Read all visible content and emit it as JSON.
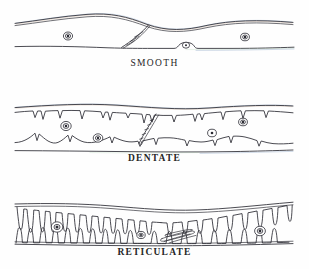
{
  "figure": {
    "background_color": "#ffffff",
    "ink_color": "#2b2b33",
    "width": 309,
    "height": 269
  },
  "panels": [
    {
      "id": "smooth",
      "label": "SMOOTH",
      "description": "Two nearly parallel wavy boundary lines enclosing a clear zone; a single oblique interdigitation near the center.",
      "nuclei_count": 3,
      "nuclei": [
        {
          "x": 68,
          "y": 36,
          "ring_r": 4.4,
          "dot_r": 1.5
        },
        {
          "x": 186,
          "y": 45,
          "ring_r": 3.4,
          "dot_r": 1.1
        },
        {
          "x": 245,
          "y": 37,
          "ring_r": 4.2,
          "dot_r": 1.4
        }
      ],
      "features": [
        "upper-undulating-margin",
        "lower-margin",
        "central-oblique-suture",
        "basal-dome"
      ]
    },
    {
      "id": "dentate",
      "label": "DENTATE",
      "description": "Boundary lines bearing short pointed tooth-like projections directed into the intervening zone.",
      "nuclei_count": 4,
      "nuclei": [
        {
          "x": 66,
          "y": 126,
          "ring_r": 5.0,
          "dot_r": 1.6
        },
        {
          "x": 98,
          "y": 138,
          "ring_r": 4.6,
          "dot_r": 1.5
        },
        {
          "x": 212,
          "y": 133,
          "ring_r": 4.3,
          "dot_r": 1.4
        },
        {
          "x": 243,
          "y": 122,
          "ring_r": 4.3,
          "dot_r": 1.4
        }
      ],
      "features": [
        "upper-outer-line",
        "upper-dentate-line",
        "lower-dentate-line",
        "lower-outer-line",
        "central-zigzag-suture"
      ]
    },
    {
      "id": "reticulate",
      "label": "RETICULATE",
      "description": "Dense interlocking finger-like lobes completely filling the zone between the outer boundary lines, forming a net-like mesh.",
      "nuclei_count": 3,
      "nuclei": [
        {
          "x": 57,
          "y": 227,
          "ring_r": 5.6,
          "dot_r": 1.8
        },
        {
          "x": 141,
          "y": 235,
          "ring_r": 4.0,
          "dot_r": 1.3
        },
        {
          "x": 260,
          "y": 231,
          "ring_r": 5.2,
          "dot_r": 1.7
        }
      ],
      "features": [
        "upper-outer-line",
        "lower-outer-line",
        "interlocking-lobes",
        "central-elongate-lobe"
      ]
    }
  ]
}
